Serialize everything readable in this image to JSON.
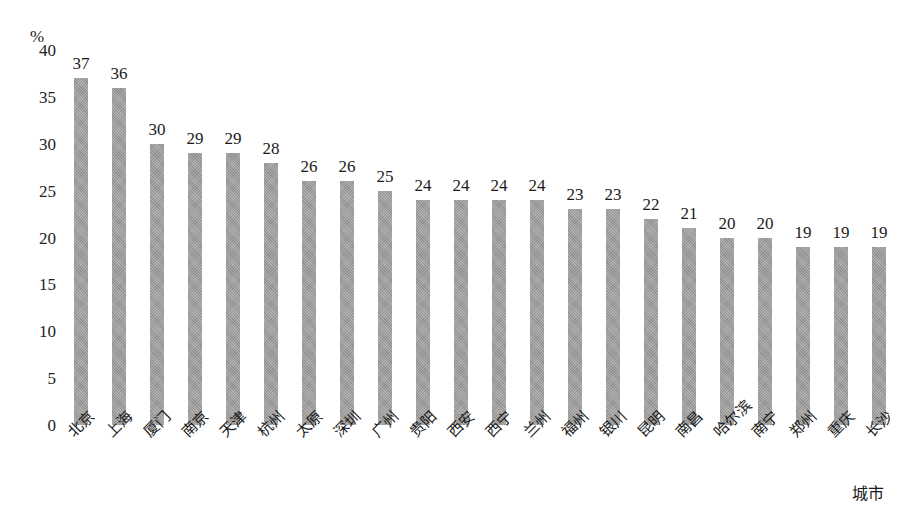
{
  "chart_data": {
    "type": "bar",
    "title": "",
    "xlabel": "城市",
    "ylabel": "%",
    "ylim": [
      0,
      40
    ],
    "yticks": [
      0,
      5,
      10,
      15,
      20,
      25,
      30,
      35,
      40
    ],
    "grid": false,
    "legend": false,
    "bar_color": "#9b9b9b",
    "background_color": "#ffffff",
    "categories": [
      "北京",
      "上海",
      "厦门",
      "南京",
      "天津",
      "杭州",
      "太原",
      "深圳",
      "广州",
      "贵阳",
      "西安",
      "西宁",
      "兰州",
      "福州",
      "银川",
      "昆明",
      "南昌",
      "哈尔滨",
      "南宁",
      "郑州",
      "重庆",
      "长沙"
    ],
    "values": [
      37,
      36,
      30,
      29,
      29,
      28,
      26,
      26,
      25,
      24,
      24,
      24,
      24,
      23,
      23,
      22,
      21,
      20,
      20,
      19,
      19,
      19
    ],
    "data_labels": [
      "37",
      "36",
      "30",
      "29",
      "29",
      "28",
      "26",
      "26",
      "25",
      "24",
      "24",
      "24",
      "24",
      "23",
      "23",
      "22",
      "21",
      "20",
      "20",
      "19",
      "19",
      "19"
    ],
    "ytick_labels": [
      "0",
      "5",
      "10",
      "15",
      "20",
      "25",
      "30",
      "35",
      "40"
    ]
  }
}
